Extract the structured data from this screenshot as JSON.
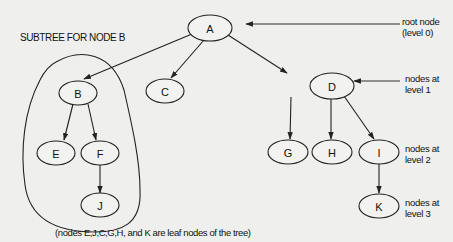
{
  "diagram": {
    "subtree_title": "SUBTREE FOR NODE B",
    "caption": "(nodes E,J,C,G,H, and K are leaf nodes of the tree)",
    "nodes": [
      {
        "id": "A",
        "label": "A",
        "level": 0
      },
      {
        "id": "B",
        "label": "B",
        "level": 1
      },
      {
        "id": "C",
        "label": "C",
        "level": 1
      },
      {
        "id": "D",
        "label": "D",
        "level": 1
      },
      {
        "id": "E",
        "label": "E",
        "level": 2
      },
      {
        "id": "F",
        "label": "F",
        "level": 2
      },
      {
        "id": "G",
        "label": "G",
        "level": 2
      },
      {
        "id": "H",
        "label": "H",
        "level": 2
      },
      {
        "id": "I",
        "label": "I",
        "level": 2
      },
      {
        "id": "J",
        "label": "J",
        "level": 3
      },
      {
        "id": "K",
        "label": "K",
        "level": 3
      }
    ],
    "edges": [
      {
        "from": "A",
        "to": "B"
      },
      {
        "from": "A",
        "to": "C"
      },
      {
        "from": "A",
        "to": "D"
      },
      {
        "from": "B",
        "to": "E"
      },
      {
        "from": "B",
        "to": "F"
      },
      {
        "from": "F",
        "to": "J"
      },
      {
        "from": "D",
        "to": "G"
      },
      {
        "from": "D",
        "to": "H"
      },
      {
        "from": "D",
        "to": "I"
      },
      {
        "from": "I",
        "to": "K"
      }
    ],
    "annotations": {
      "root": {
        "line1": "root node",
        "line2": "(level 0)"
      },
      "level1": {
        "line1": "nodes at",
        "line2": "level 1"
      },
      "level2": {
        "line1": "nodes at",
        "line2": "level 2"
      },
      "level3": {
        "line1": "nodes at",
        "line2": "level 3"
      }
    },
    "leaf_nodes": [
      "E",
      "J",
      "C",
      "G",
      "H",
      "K"
    ],
    "highlighted_subtree_root": "B"
  }
}
